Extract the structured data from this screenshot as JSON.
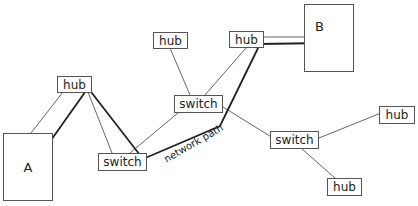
{
  "diagram": {
    "endpoints": [
      {
        "id": "A",
        "label": "A"
      },
      {
        "id": "B",
        "label": "B"
      }
    ],
    "nodes": [
      {
        "id": "hub1",
        "label": "hub"
      },
      {
        "id": "switch1",
        "label": "switch"
      },
      {
        "id": "hub2",
        "label": "hub"
      },
      {
        "id": "switch2",
        "label": "switch"
      },
      {
        "id": "hub3",
        "label": "hub"
      },
      {
        "id": "switch3",
        "label": "switch"
      },
      {
        "id": "hub4",
        "label": "hub"
      },
      {
        "id": "hub5",
        "label": "hub"
      }
    ],
    "path_label": "network path",
    "colors": {
      "line": "#666666",
      "path": "#222222",
      "border": "#555555"
    }
  }
}
